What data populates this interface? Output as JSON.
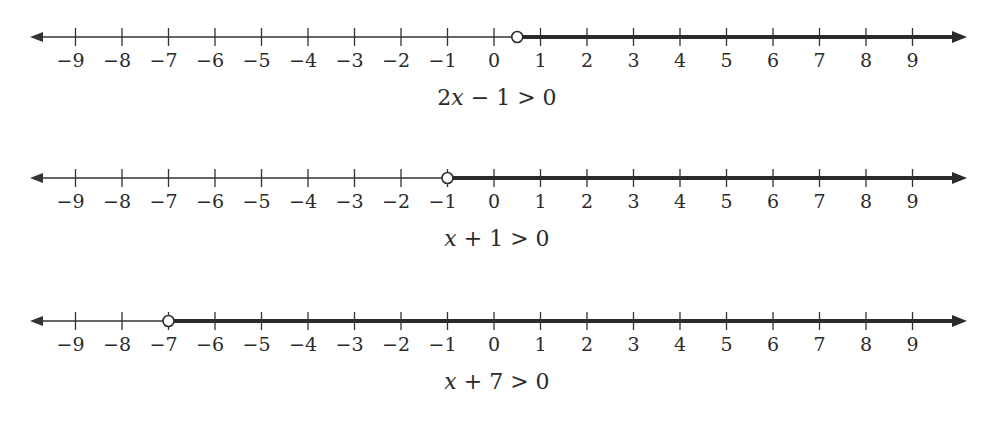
{
  "diagram": {
    "axis": {
      "min": -9,
      "max": 9,
      "ticks": [
        -9,
        -8,
        -7,
        -6,
        -5,
        -4,
        -3,
        -2,
        -1,
        0,
        1,
        2,
        3,
        4,
        5,
        6,
        7,
        8,
        9
      ],
      "tick_labels": [
        "−9",
        "−8",
        "−7",
        "−6",
        "−5",
        "−4",
        "−3",
        "−2",
        "−1",
        "0",
        "1",
        "2",
        "3",
        "4",
        "5",
        "6",
        "7",
        "8",
        "9"
      ]
    },
    "number_lines": [
      {
        "inequality": "2x − 1 > 0",
        "caption_parts": [
          "2",
          "x",
          " − 1 > 0"
        ],
        "boundary": 0.5,
        "boundary_type": "open",
        "direction": "right",
        "line_y": 37
      },
      {
        "inequality": "x + 1 > 0",
        "caption_parts": [
          "",
          "x",
          " + 1 > 0"
        ],
        "boundary": -1,
        "boundary_type": "open",
        "direction": "right",
        "line_y": 178
      },
      {
        "inequality": "x + 7 > 0",
        "caption_parts": [
          "",
          "x",
          " + 7 > 0"
        ],
        "boundary": -7,
        "boundary_type": "open",
        "direction": "right",
        "line_y": 321
      }
    ],
    "colors": {
      "line": "#333333",
      "shaded": "#2b2b2b",
      "text": "#2a2a2a",
      "background": "#ffffff"
    }
  }
}
